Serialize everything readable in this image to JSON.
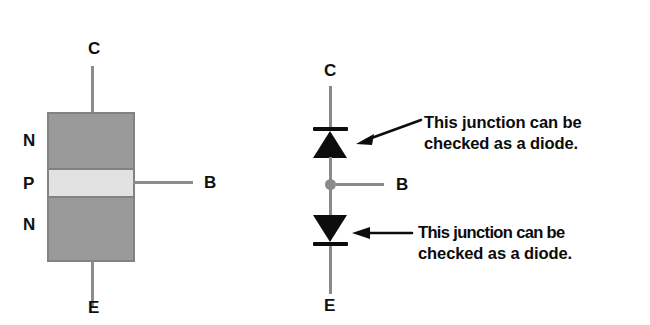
{
  "figure": {
    "title_visible": false,
    "background_color": "#ffffff",
    "ink_color": "#0d0d0d",
    "semiconductor_fill_n": "#9a9a9a",
    "semiconductor_fill_p": "#e2e2e2",
    "lead_color": "#8a8a8a"
  },
  "left_diagram": {
    "name": "npn-transistor-structure",
    "terminals": {
      "collector": "C",
      "base": "B",
      "emitter": "E"
    },
    "layers": [
      {
        "label": "N",
        "type": "n-region"
      },
      {
        "label": "P",
        "type": "p-region"
      },
      {
        "label": "N",
        "type": "n-region"
      }
    ]
  },
  "right_diagram": {
    "name": "npn-two-diode-equivalent",
    "terminals": {
      "collector": "C",
      "base": "B",
      "emitter": "E"
    },
    "diodes": [
      {
        "id": "upper-diode",
        "orientation": "pointing-up",
        "junction": "base-collector"
      },
      {
        "id": "lower-diode",
        "orientation": "pointing-down",
        "junction": "base-emitter"
      }
    ],
    "callouts": [
      {
        "id": "upper-callout",
        "line1": "This junction can be",
        "line2": "checked as a diode.",
        "arrow": "diagonal-left-down"
      },
      {
        "id": "lower-callout",
        "line1": "This junction can be",
        "line2": "checked as a diode.",
        "arrow": "horizontal-left"
      }
    ]
  }
}
